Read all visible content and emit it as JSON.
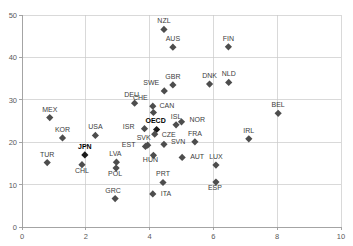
{
  "chart_data": {
    "type": "scatter",
    "title": "",
    "subtitle": "",
    "xlabel": "",
    "ylabel": "",
    "xlim": [
      0,
      10
    ],
    "ylim": [
      0,
      50
    ],
    "xticks": [
      "0",
      "2",
      "4",
      "6",
      "8",
      "10"
    ],
    "xtick_values": [
      0,
      2,
      4,
      6,
      8,
      10
    ],
    "yticks": [
      "0",
      "10",
      "20",
      "30",
      "40",
      "50"
    ],
    "ytick_values": [
      0,
      10,
      20,
      30,
      40,
      50
    ],
    "grid": true,
    "legend": "none",
    "marker": "diamond",
    "marker_color": "#4d4d4d",
    "highlight_color": "#1a1a1a",
    "points": [
      {
        "label": "NZL",
        "x": 4.45,
        "y": 46.6,
        "label_dx": 0,
        "label_dy": -6,
        "bold": false
      },
      {
        "label": "AUS",
        "x": 4.73,
        "y": 42.4,
        "label_dx": 0,
        "label_dy": -6,
        "bold": false
      },
      {
        "label": "FIN",
        "x": 6.47,
        "y": 42.5,
        "label_dx": 0,
        "label_dy": -6,
        "bold": false
      },
      {
        "label": "GBR",
        "x": 4.73,
        "y": 33.5,
        "label_dx": 0,
        "label_dy": -6,
        "bold": false
      },
      {
        "label": "DNK",
        "x": 5.88,
        "y": 33.7,
        "label_dx": 0,
        "label_dy": -6,
        "bold": false
      },
      {
        "label": "NLD",
        "x": 6.48,
        "y": 34.1,
        "label_dx": 0,
        "label_dy": -6,
        "bold": false
      },
      {
        "label": "SWE",
        "x": 4.46,
        "y": 32.1,
        "label_dx": -5,
        "label_dy": -6,
        "bold": false
      },
      {
        "label": "DEU",
        "x": 3.53,
        "y": 29.2,
        "label_dx": -3,
        "label_dy": -6,
        "bold": false
      },
      {
        "label": "CHE",
        "x": 4.1,
        "y": 28.5,
        "label_dx": -5,
        "label_dy": -6,
        "bold": false
      },
      {
        "label": "BEL",
        "x": 8.03,
        "y": 26.8,
        "label_dx": 0,
        "label_dy": -6,
        "bold": false
      },
      {
        "label": "MEX",
        "x": 0.87,
        "y": 25.8,
        "label_dx": 0,
        "label_dy": -6,
        "bold": false
      },
      {
        "label": "CAN",
        "x": 4.12,
        "y": 27.0,
        "label_dx": 6,
        "label_dy": -5,
        "bold": false
      },
      {
        "label": "ISL",
        "x": 4.83,
        "y": 24.1,
        "label_dx": 0,
        "label_dy": -6,
        "bold": false
      },
      {
        "label": "NOR",
        "x": 5.0,
        "y": 24.8,
        "label_dx": 8,
        "label_dy": 0,
        "bold": false
      },
      {
        "label": "OECD",
        "x": 4.22,
        "y": 23.0,
        "label_dx": -1,
        "label_dy": -6,
        "bold": true
      },
      {
        "label": "IRL",
        "x": 7.11,
        "y": 20.8,
        "label_dx": 0,
        "label_dy": -6,
        "bold": false
      },
      {
        "label": "ISR",
        "x": 3.84,
        "y": 23.2,
        "label_dx": -10,
        "label_dy": 0,
        "bold": false
      },
      {
        "label": "USA",
        "x": 2.3,
        "y": 21.6,
        "label_dx": 0,
        "label_dy": -6,
        "bold": false
      },
      {
        "label": "KOR",
        "x": 1.27,
        "y": 21.0,
        "label_dx": 0,
        "label_dy": -6,
        "bold": false
      },
      {
        "label": "CZE",
        "x": 4.16,
        "y": 21.9,
        "label_dx": 7,
        "label_dy": 3,
        "bold": false
      },
      {
        "label": "FRA",
        "x": 5.42,
        "y": 20.1,
        "label_dx": 0,
        "label_dy": -6,
        "bold": false
      },
      {
        "label": "SVN",
        "x": 4.45,
        "y": 19.5,
        "label_dx": 7,
        "label_dy": 0,
        "bold": false
      },
      {
        "label": "SVK",
        "x": 3.94,
        "y": 19.3,
        "label_dx": -4,
        "label_dy": -5,
        "bold": false
      },
      {
        "label": "EST",
        "x": 3.87,
        "y": 19.0,
        "label_dx": -10,
        "label_dy": 1,
        "bold": false
      },
      {
        "label": "JPN",
        "x": 1.97,
        "y": 17.0,
        "label_dx": 0,
        "label_dy": -6,
        "bold": true
      },
      {
        "label": "AUT",
        "x": 5.02,
        "y": 16.4,
        "label_dx": 8,
        "label_dy": 2,
        "bold": false
      },
      {
        "label": "HUN",
        "x": 4.12,
        "y": 16.9,
        "label_dx": -3,
        "label_dy": 7,
        "bold": false
      },
      {
        "label": "LUX",
        "x": 6.08,
        "y": 14.6,
        "label_dx": 0,
        "label_dy": -6,
        "bold": false
      },
      {
        "label": "TUR",
        "x": 0.79,
        "y": 15.2,
        "label_dx": 0,
        "label_dy": -6,
        "bold": false
      },
      {
        "label": "LVA",
        "x": 2.96,
        "y": 15.3,
        "label_dx": -1,
        "label_dy": -6,
        "bold": false
      },
      {
        "label": "CHL",
        "x": 1.88,
        "y": 14.7,
        "label_dx": 0,
        "label_dy": 8,
        "bold": false
      },
      {
        "label": "POL",
        "x": 2.95,
        "y": 13.9,
        "label_dx": -1,
        "label_dy": 8,
        "bold": false
      },
      {
        "label": "PRT",
        "x": 4.42,
        "y": 10.5,
        "label_dx": 0,
        "label_dy": -6,
        "bold": false
      },
      {
        "label": "ESP",
        "x": 6.08,
        "y": 10.6,
        "label_dx": -1,
        "label_dy": 8,
        "bold": false
      },
      {
        "label": "ITA",
        "x": 4.1,
        "y": 7.8,
        "label_dx": 8,
        "label_dy": 2,
        "bold": false
      },
      {
        "label": "GRC",
        "x": 2.92,
        "y": 6.7,
        "label_dx": -2,
        "label_dy": -6,
        "bold": false
      }
    ]
  }
}
